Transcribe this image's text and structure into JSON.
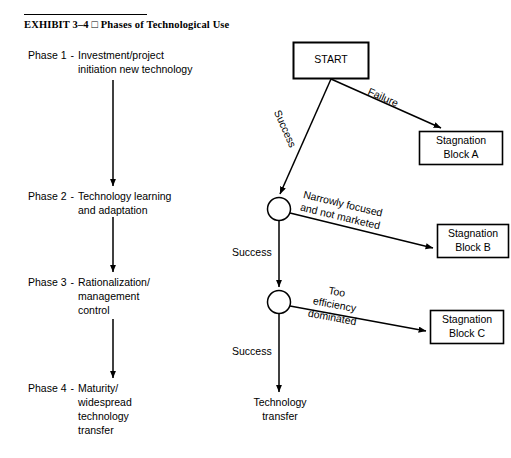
{
  "exhibit": {
    "number": "EXHIBIT 3–4",
    "separator": "□",
    "title": "Phases of Technological Use",
    "full_heading": "EXHIBIT 3–4 □ Phases of Technological Use"
  },
  "left_column": {
    "phases": [
      {
        "key": "Phase 1",
        "dash": "-",
        "body": "Investment/project\ninitiation new technology"
      },
      {
        "key": "Phase 2",
        "dash": "-",
        "body": "Technology learning\nand adaptation"
      },
      {
        "key": "Phase 3",
        "dash": "-",
        "body": "Rationalization/\nmanagement\ncontrol"
      },
      {
        "key": "Phase 4",
        "dash": "-",
        "body": "Maturity/\nwidespread\ntechnology\ntransfer"
      }
    ]
  },
  "flowchart": {
    "start_box": "START",
    "stagnation_a": "Stagnation\nBlock A",
    "stagnation_b": "Stagnation\nBlock B",
    "stagnation_c": "Stagnation\nBlock C",
    "terminal": "Technology\ntransfer",
    "edge_failure": "Failure",
    "edge_success_1": "Success",
    "edge_success_2": "Success",
    "edge_success_3": "Success",
    "edge_narrow": "Narrowly focused\nand not marketed",
    "edge_efficiency": "Too\nefficiency\ndominated"
  },
  "style": {
    "stroke": "#000000",
    "background": "#ffffff"
  }
}
